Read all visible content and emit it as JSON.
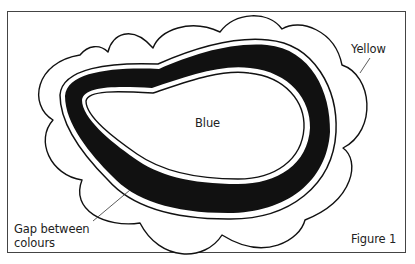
{
  "figure": {
    "caption": "Figure 1",
    "top_cut_text": "",
    "labels": {
      "center": "Blue",
      "outer": "Yellow",
      "gap_line1": "Gap between",
      "gap_line2": "colours"
    },
    "regions": [
      {
        "name": "Blue",
        "role": "inner area",
        "fill": "#ffffff"
      },
      {
        "name": "black band",
        "role": "boundary stripe",
        "fill": "#111111"
      },
      {
        "name": "Yellow",
        "role": "outer cloud area",
        "fill": "#ffffff"
      }
    ],
    "colors": {
      "stroke": "#111111",
      "frame": "#444444",
      "background": "#ffffff",
      "text": "#222222"
    }
  }
}
